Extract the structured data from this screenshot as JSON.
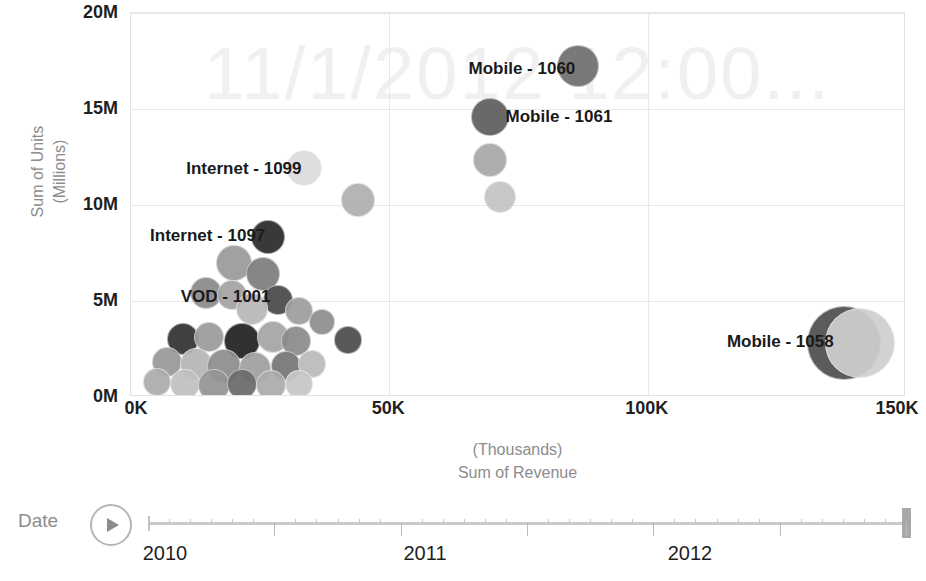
{
  "watermark": {
    "text": "11/1/2012 12:00..."
  },
  "axes": {
    "y": {
      "title_line1": "Sum of Units",
      "title_line2": "(Millions)",
      "ticks": [
        "20M",
        "15M",
        "10M",
        "5M",
        "0M"
      ],
      "values": [
        20,
        15,
        10,
        5,
        0
      ],
      "min": 0,
      "max": 20
    },
    "x": {
      "title_line1": "(Thousands)",
      "title_line2": "Sum of Revenue",
      "ticks": [
        "0K",
        "50K",
        "100K",
        "150K"
      ],
      "values": [
        0,
        50,
        100,
        150
      ],
      "min": 0,
      "max": 150
    }
  },
  "timeline": {
    "label": "Date",
    "play_icon": "play-icon",
    "years": [
      "2010",
      "2011",
      "2012"
    ],
    "year_positions": [
      0.02,
      0.735,
      0.745
    ],
    "thumb_position": 1.0
  },
  "labels": [
    {
      "text": "Mobile - 1060",
      "anchor": "right",
      "x": 86,
      "y": 17.1
    },
    {
      "text": "Mobile - 1061",
      "anchor": "left",
      "x": 72.5,
      "y": 14.6
    },
    {
      "text": "Internet - 1099",
      "anchor": "right",
      "x": 33,
      "y": 11.9
    },
    {
      "text": "Internet - 1097",
      "anchor": "right",
      "x": 26,
      "y": 8.4
    },
    {
      "text": "VOD - 1001",
      "anchor": "right",
      "x": 27,
      "y": 5.2
    },
    {
      "text": "Mobile - 1058",
      "anchor": "right",
      "x": 136,
      "y": 2.85
    }
  ],
  "chart_data": {
    "type": "scatter",
    "title": "",
    "xlabel": "Sum of Revenue (Thousands)",
    "ylabel": "Sum of Units (Millions)",
    "xlim": [
      0,
      150
    ],
    "ylim": [
      0,
      20
    ],
    "grid": true,
    "legend": "none",
    "annotation": "11/1/2012 12:00...",
    "points": [
      {
        "label": "Mobile - 1060",
        "x": 86.5,
        "y": 17.25,
        "r": 21,
        "color": "#6f6f6f"
      },
      {
        "label": "Mobile - 1061",
        "x": 69.5,
        "y": 14.6,
        "r": 19,
        "color": "#5e5e5e"
      },
      {
        "label": "",
        "x": 69.5,
        "y": 12.35,
        "r": 17,
        "color": "#a8a8a8"
      },
      {
        "label": "",
        "x": 71.5,
        "y": 10.4,
        "r": 16,
        "color": "#c4c4c4"
      },
      {
        "label": "Internet - 1099",
        "x": 33.5,
        "y": 11.95,
        "r": 18,
        "color": "#dcdcdc"
      },
      {
        "label": "",
        "x": 44,
        "y": 10.25,
        "r": 17,
        "color": "#b0b0b0"
      },
      {
        "label": "Internet - 1097",
        "x": 26.5,
        "y": 8.35,
        "r": 17,
        "color": "#2b2b2b"
      },
      {
        "label": "",
        "x": 20,
        "y": 7.0,
        "r": 18,
        "color": "#9a9a9a"
      },
      {
        "label": "",
        "x": 25.5,
        "y": 6.4,
        "r": 17,
        "color": "#7d7d7d"
      },
      {
        "label": "",
        "x": 14.5,
        "y": 5.4,
        "r": 16,
        "color": "#8a8a8a"
      },
      {
        "label": "",
        "x": 19.5,
        "y": 5.3,
        "r": 15,
        "color": "#a3a3a3"
      },
      {
        "label": "VOD - 1001",
        "x": 28.5,
        "y": 5.05,
        "r": 15,
        "color": "#4a4a4a"
      },
      {
        "label": "",
        "x": 23.5,
        "y": 4.6,
        "r": 16,
        "color": "#b8b8b8"
      },
      {
        "label": "",
        "x": 32.5,
        "y": 4.5,
        "r": 14,
        "color": "#9e9e9e"
      },
      {
        "label": "",
        "x": 37,
        "y": 3.9,
        "r": 13,
        "color": "#8f8f8f"
      },
      {
        "label": "",
        "x": 10,
        "y": 3.0,
        "r": 16,
        "color": "#333333"
      },
      {
        "label": "",
        "x": 15,
        "y": 3.1,
        "r": 15,
        "color": "#9c9c9c"
      },
      {
        "label": "",
        "x": 21.5,
        "y": 2.9,
        "r": 18,
        "color": "#222222"
      },
      {
        "label": "",
        "x": 27.5,
        "y": 3.1,
        "r": 16,
        "color": "#a5a5a5"
      },
      {
        "label": "",
        "x": 32,
        "y": 2.9,
        "r": 15,
        "color": "#8b8b8b"
      },
      {
        "label": "",
        "x": 42,
        "y": 2.95,
        "r": 14,
        "color": "#4d4d4d"
      },
      {
        "label": "",
        "x": 7,
        "y": 1.8,
        "r": 15,
        "color": "#999999"
      },
      {
        "label": "",
        "x": 12.5,
        "y": 1.7,
        "r": 16,
        "color": "#b5b5b5"
      },
      {
        "label": "",
        "x": 18,
        "y": 1.6,
        "r": 17,
        "color": "#8d8d8d"
      },
      {
        "label": "",
        "x": 24,
        "y": 1.5,
        "r": 16,
        "color": "#a0a0a0"
      },
      {
        "label": "",
        "x": 30,
        "y": 1.6,
        "r": 15,
        "color": "#777777"
      },
      {
        "label": "",
        "x": 35,
        "y": 1.7,
        "r": 14,
        "color": "#bbbbbb"
      },
      {
        "label": "",
        "x": 5,
        "y": 0.8,
        "r": 14,
        "color": "#adadad"
      },
      {
        "label": "",
        "x": 10.5,
        "y": 0.7,
        "r": 15,
        "color": "#c0c0c0"
      },
      {
        "label": "",
        "x": 16,
        "y": 0.6,
        "r": 16,
        "color": "#949494"
      },
      {
        "label": "",
        "x": 21.5,
        "y": 0.7,
        "r": 15,
        "color": "#6b6b6b"
      },
      {
        "label": "",
        "x": 27,
        "y": 0.6,
        "r": 15,
        "color": "#acacac"
      },
      {
        "label": "",
        "x": 32.5,
        "y": 0.7,
        "r": 14,
        "color": "#c6c6c6"
      },
      {
        "label": "Mobile - 1058",
        "x": 138,
        "y": 2.8,
        "r": 37,
        "color": "#4f4f4f"
      },
      {
        "label": "",
        "x": 141,
        "y": 2.8,
        "r": 35,
        "color": "#cfcfcf"
      }
    ]
  }
}
